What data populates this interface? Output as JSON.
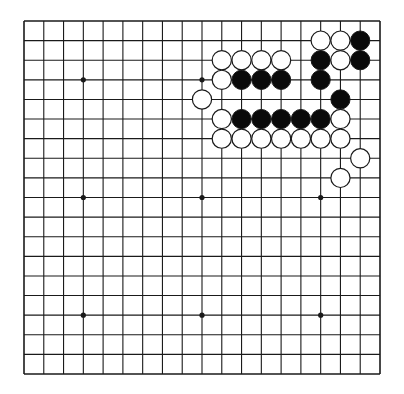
{
  "diagram": {
    "type": "go-board",
    "size": 19,
    "colors": {
      "background": "#ffffff",
      "line": "#1a1a1a",
      "black_stone": "#0a0a0a",
      "white_stone": "#ffffff",
      "stone_outline": "#1a1a1a"
    },
    "geometry": {
      "left": 24,
      "top": 21,
      "right": 380,
      "bottom": 374,
      "stone_radius": 9.6,
      "hoshi_radius": 2.6
    },
    "hoshi": [
      [
        3,
        3
      ],
      [
        9,
        3
      ],
      [
        15,
        3
      ],
      [
        3,
        9
      ],
      [
        9,
        9
      ],
      [
        15,
        9
      ],
      [
        3,
        15
      ],
      [
        9,
        15
      ],
      [
        15,
        15
      ]
    ],
    "stones": [
      {
        "col": 15,
        "row": 1,
        "color": "white"
      },
      {
        "col": 16,
        "row": 1,
        "color": "white"
      },
      {
        "col": 17,
        "row": 1,
        "color": "black"
      },
      {
        "col": 10,
        "row": 2,
        "color": "white"
      },
      {
        "col": 11,
        "row": 2,
        "color": "white"
      },
      {
        "col": 12,
        "row": 2,
        "color": "white"
      },
      {
        "col": 13,
        "row": 2,
        "color": "white"
      },
      {
        "col": 15,
        "row": 2,
        "color": "black"
      },
      {
        "col": 16,
        "row": 2,
        "color": "white"
      },
      {
        "col": 17,
        "row": 2,
        "color": "black"
      },
      {
        "col": 10,
        "row": 3,
        "color": "white"
      },
      {
        "col": 11,
        "row": 3,
        "color": "black"
      },
      {
        "col": 12,
        "row": 3,
        "color": "black"
      },
      {
        "col": 13,
        "row": 3,
        "color": "black"
      },
      {
        "col": 15,
        "row": 3,
        "color": "black"
      },
      {
        "col": 9,
        "row": 4,
        "color": "white"
      },
      {
        "col": 16,
        "row": 4,
        "color": "black"
      },
      {
        "col": 10,
        "row": 5,
        "color": "white"
      },
      {
        "col": 11,
        "row": 5,
        "color": "black"
      },
      {
        "col": 12,
        "row": 5,
        "color": "black"
      },
      {
        "col": 13,
        "row": 5,
        "color": "black"
      },
      {
        "col": 14,
        "row": 5,
        "color": "black"
      },
      {
        "col": 15,
        "row": 5,
        "color": "black"
      },
      {
        "col": 16,
        "row": 5,
        "color": "white"
      },
      {
        "col": 10,
        "row": 6,
        "color": "white"
      },
      {
        "col": 11,
        "row": 6,
        "color": "white"
      },
      {
        "col": 12,
        "row": 6,
        "color": "white"
      },
      {
        "col": 13,
        "row": 6,
        "color": "white"
      },
      {
        "col": 14,
        "row": 6,
        "color": "white"
      },
      {
        "col": 15,
        "row": 6,
        "color": "white"
      },
      {
        "col": 16,
        "row": 6,
        "color": "white"
      },
      {
        "col": 17,
        "row": 7,
        "color": "white"
      },
      {
        "col": 16,
        "row": 8,
        "color": "white"
      }
    ]
  }
}
